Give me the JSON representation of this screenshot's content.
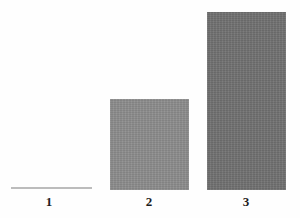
{
  "chart_data": {
    "type": "bar",
    "title": "",
    "subtitle": "",
    "xlabel": "",
    "ylabel": "",
    "categories": [
      "1",
      "2",
      "3"
    ],
    "values": [
      0,
      91,
      178
    ],
    "ylim": [
      0,
      190
    ],
    "grid": false,
    "legend": null,
    "annotations": [],
    "series": [
      {
        "name": "",
        "values": [
          0,
          91,
          178
        ]
      }
    ],
    "bar_colors": [
      "#bcbcbc",
      "#8b8b8b",
      "#707070"
    ],
    "background_color": "#fefefe",
    "tick_label_color": "#1d1d1d"
  },
  "axis": {
    "tick_labels": [
      {
        "text": "1"
      },
      {
        "text": "2"
      },
      {
        "text": "3"
      }
    ]
  }
}
